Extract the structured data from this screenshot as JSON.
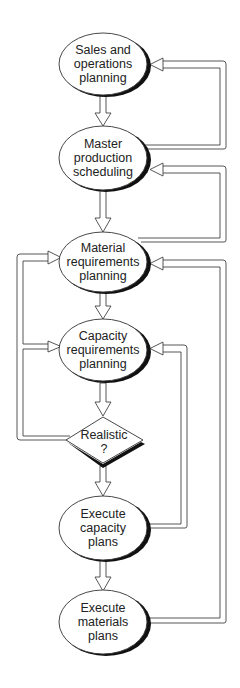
{
  "diagram": {
    "type": "flowchart",
    "nodes": [
      {
        "id": "sop",
        "shape": "ellipse",
        "label": "Sales and\noperations\nplanning",
        "cx": 103,
        "cy": 64
      },
      {
        "id": "mps",
        "shape": "ellipse",
        "label": "Master\nproduction\nscheduling",
        "cx": 103,
        "cy": 158
      },
      {
        "id": "mrp",
        "shape": "ellipse",
        "label": "Material\nrequirements\nplanning",
        "cx": 103,
        "cy": 262
      },
      {
        "id": "crp",
        "shape": "ellipse",
        "label": "Capacity\nrequirements\nplanning",
        "cx": 103,
        "cy": 352
      },
      {
        "id": "realistic",
        "shape": "diamond",
        "label": "Realistic\n?",
        "cx": 103,
        "cy": 442
      },
      {
        "id": "exec_cap",
        "shape": "ellipse",
        "label": "Execute\ncapacity\nplans",
        "cx": 103,
        "cy": 528
      },
      {
        "id": "exec_mat",
        "shape": "ellipse",
        "label": "Execute\nmaterials\nplans",
        "cx": 103,
        "cy": 622
      }
    ],
    "edges": [
      {
        "from": "sop",
        "to": "mps"
      },
      {
        "from": "mps",
        "to": "mrp"
      },
      {
        "from": "mrp",
        "to": "crp"
      },
      {
        "from": "crp",
        "to": "realistic"
      },
      {
        "from": "realistic",
        "to": "exec_cap"
      },
      {
        "from": "exec_cap",
        "to": "exec_mat"
      },
      {
        "from": "mps",
        "to": "sop",
        "kind": "feedback-right"
      },
      {
        "from": "mrp",
        "to": "mps",
        "kind": "feedback-right"
      },
      {
        "from": "exec_mat",
        "to": "mrp",
        "kind": "feedback-right"
      },
      {
        "from": "exec_cap",
        "to": "crp",
        "kind": "feedback-right"
      },
      {
        "from": "realistic",
        "to": "mrp",
        "kind": "feedback-left"
      },
      {
        "from": "realistic",
        "to": "crp",
        "kind": "feedback-left"
      }
    ]
  }
}
